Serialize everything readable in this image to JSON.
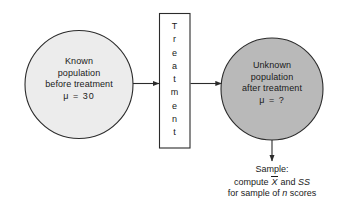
{
  "diagram": {
    "colors": {
      "background": "#ffffff",
      "stroke": "#2b2b2b",
      "text": "#1a1a1a",
      "known_population_fill": "#ececec",
      "unknown_population_fill": "#b9b9b9",
      "treatment_box_fill": "#ffffff"
    },
    "known_population": {
      "name": "known-population-circle",
      "line1": "Known",
      "line2": "population",
      "line3": "before treatment",
      "line4": "μ  =  30"
    },
    "treatment": {
      "name": "treatment-box",
      "label": "Treatment",
      "letters": [
        "T",
        "r",
        "e",
        "a",
        "t",
        "m",
        "e",
        "n",
        "t"
      ]
    },
    "unknown_population": {
      "name": "unknown-population-circle",
      "line1": "Unknown",
      "line2": "population",
      "line3": "after treatment",
      "line4": "μ  =  ?"
    },
    "sample_caption": {
      "line1": "Sample:",
      "line2_prefix": "compute ",
      "line2_xbar": "X",
      "line2_mid": " and ",
      "line2_ss": "SS",
      "line3_prefix": "for sample of ",
      "line3_n": "n",
      "line3_suffix": " scores"
    },
    "arrows": [
      {
        "name": "arrow-known-to-treatment",
        "direction": "right"
      },
      {
        "name": "arrow-treatment-to-unknown",
        "direction": "right"
      },
      {
        "name": "arrow-unknown-to-sample",
        "direction": "down"
      }
    ]
  }
}
